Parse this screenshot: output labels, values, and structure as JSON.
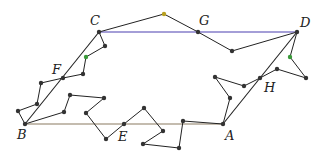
{
  "diagram": {
    "type": "parallelogram-with-random-walks",
    "colors": {
      "top_edge": "#4a3fb0",
      "bottom_edge": "#8a7a60",
      "walk": "#222222",
      "dot": "#333333",
      "green_dot": "#3a9a3a",
      "yellow_dot": "#b8a020"
    },
    "labels": [
      {
        "id": "C",
        "text": "C",
        "x": 90,
        "y": 14
      },
      {
        "id": "G",
        "text": "G",
        "x": 199,
        "y": 14
      },
      {
        "id": "D",
        "text": "D",
        "x": 300,
        "y": 16
      },
      {
        "id": "F",
        "text": "F",
        "x": 52,
        "y": 63
      },
      {
        "id": "H",
        "text": "H",
        "x": 264,
        "y": 81
      },
      {
        "id": "B",
        "text": "B",
        "x": 17,
        "y": 128
      },
      {
        "id": "E",
        "text": "E",
        "x": 118,
        "y": 130
      },
      {
        "id": "A",
        "text": "A",
        "x": 225,
        "y": 129
      }
    ],
    "points": {
      "C": [
        99,
        32
      ],
      "D": [
        297,
        32
      ],
      "B": [
        25,
        124
      ],
      "A": [
        223,
        124
      ],
      "G": [
        198,
        32
      ],
      "F": [
        63,
        78
      ],
      "E": [
        124,
        124
      ],
      "H": [
        260,
        78
      ]
    },
    "edges": [
      {
        "from": "C",
        "to": "D",
        "color": "top_edge"
      },
      {
        "from": "B",
        "to": "A",
        "color": "bottom_edge"
      },
      {
        "from": "B",
        "to": "C",
        "color": "walk"
      },
      {
        "from": "A",
        "to": "D",
        "color": "walk"
      }
    ],
    "walks": [
      {
        "name": "C-G-D",
        "path": [
          [
            99,
            32
          ],
          [
            164,
            14
          ],
          [
            198,
            32
          ],
          [
            232,
            51
          ],
          [
            297,
            32
          ]
        ]
      },
      {
        "name": "C-F-B",
        "path": [
          [
            99,
            32
          ],
          [
            105,
            46
          ],
          [
            86,
            57
          ],
          [
            83,
            74
          ],
          [
            63,
            78
          ],
          [
            41,
            83
          ],
          [
            37,
            104
          ],
          [
            18,
            111
          ],
          [
            25,
            124
          ]
        ]
      },
      {
        "name": "B-E-A",
        "path": [
          [
            25,
            124
          ],
          [
            64,
            112
          ],
          [
            70,
            95
          ],
          [
            104,
            98
          ],
          [
            86,
            113
          ],
          [
            106,
            139
          ],
          [
            124,
            124
          ],
          [
            144,
            108
          ],
          [
            163,
            131
          ],
          [
            143,
            144
          ],
          [
            179,
            148
          ],
          [
            183,
            121
          ],
          [
            223,
            124
          ]
        ]
      },
      {
        "name": "D-H-A",
        "path": [
          [
            297,
            32
          ],
          [
            290,
            57
          ],
          [
            306,
            78
          ],
          [
            277,
            69
          ],
          [
            260,
            78
          ],
          [
            244,
            86
          ],
          [
            215,
            77
          ],
          [
            230,
            98
          ],
          [
            223,
            124
          ]
        ]
      }
    ],
    "dots": [
      {
        "x": 164,
        "y": 14,
        "color": "yellow_dot"
      },
      {
        "x": 232,
        "y": 51,
        "color": "dot"
      },
      {
        "x": 290,
        "y": 57,
        "color": "green_dot"
      },
      {
        "x": 306,
        "y": 78,
        "color": "dot"
      },
      {
        "x": 277,
        "y": 69,
        "color": "dot"
      },
      {
        "x": 244,
        "y": 86,
        "color": "dot"
      },
      {
        "x": 215,
        "y": 77,
        "color": "dot"
      },
      {
        "x": 230,
        "y": 98,
        "color": "dot"
      },
      {
        "x": 105,
        "y": 46,
        "color": "dot"
      },
      {
        "x": 86,
        "y": 57,
        "color": "green_dot"
      },
      {
        "x": 83,
        "y": 74,
        "color": "dot"
      },
      {
        "x": 41,
        "y": 83,
        "color": "dot"
      },
      {
        "x": 37,
        "y": 104,
        "color": "dot"
      },
      {
        "x": 18,
        "y": 111,
        "color": "dot"
      },
      {
        "x": 64,
        "y": 112,
        "color": "dot"
      },
      {
        "x": 70,
        "y": 95,
        "color": "dot"
      },
      {
        "x": 104,
        "y": 98,
        "color": "dot"
      },
      {
        "x": 86,
        "y": 113,
        "color": "dot"
      },
      {
        "x": 106,
        "y": 139,
        "color": "dot"
      },
      {
        "x": 144,
        "y": 108,
        "color": "dot"
      },
      {
        "x": 163,
        "y": 131,
        "color": "dot"
      },
      {
        "x": 143,
        "y": 144,
        "color": "dot"
      },
      {
        "x": 179,
        "y": 148,
        "color": "dot"
      },
      {
        "x": 183,
        "y": 121,
        "color": "dot"
      },
      {
        "x": 99,
        "y": 32,
        "color": "dot"
      },
      {
        "x": 198,
        "y": 32,
        "color": "dot"
      },
      {
        "x": 297,
        "y": 32,
        "color": "dot"
      },
      {
        "x": 63,
        "y": 78,
        "color": "dot"
      },
      {
        "x": 260,
        "y": 78,
        "color": "dot"
      },
      {
        "x": 25,
        "y": 124,
        "color": "dot"
      },
      {
        "x": 124,
        "y": 124,
        "color": "dot"
      },
      {
        "x": 223,
        "y": 124,
        "color": "dot"
      }
    ]
  }
}
